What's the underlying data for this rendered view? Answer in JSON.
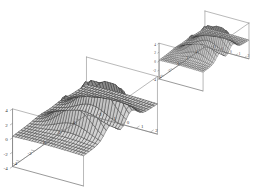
{
  "figure": {
    "title": "",
    "background_color": "#ffffff",
    "plot_count": 2
  },
  "chart_data": [
    {
      "id": "plot-large",
      "type": "surface",
      "title": "",
      "xlabel": "",
      "ylabel": "",
      "zlabel": "",
      "grid": false,
      "legend": "none",
      "xlim": [
        -5,
        5
      ],
      "ylim": [
        -2.5,
        2.5
      ],
      "zlim": [
        -4,
        4
      ],
      "xticks": [
        -4,
        -2,
        0,
        2,
        4
      ],
      "xtick_labels": [
        "-4",
        "-2",
        "0",
        "2",
        "4"
      ],
      "yticks": [
        -2,
        -1,
        0,
        1,
        2
      ],
      "ytick_labels": [
        "-2",
        "-1",
        "0",
        "1",
        "2"
      ],
      "zticks": [
        -4,
        -2,
        0,
        2,
        4
      ],
      "ztick_labels": [
        "-4",
        "-2",
        "0",
        "2",
        "4"
      ],
      "mesh_nx": 26,
      "mesh_ny": 26,
      "surface_fill": "#b4b4b4",
      "surface_fill_light": "#d8d8d8",
      "surface_fill_dark": "#8c8c8c",
      "mesh_line_color": "#2e2e2e",
      "view_azimuth": -58,
      "view_elevation": 26,
      "scale": 1.0,
      "description": "Two tall ridge peaks separated by a central saddle valley, rising from a flat plain"
    },
    {
      "id": "plot-inset",
      "type": "surface",
      "title": "",
      "xlabel": "",
      "ylabel": "",
      "zlabel": "",
      "grid": false,
      "legend": "none",
      "xlim": [
        -5,
        5
      ],
      "ylim": [
        -2.5,
        2.5
      ],
      "zlim": [
        -4,
        4
      ],
      "xticks": [
        -4,
        -2,
        0,
        2,
        4
      ],
      "xtick_labels": [
        "-4",
        "-2",
        "0",
        "2",
        "4"
      ],
      "yticks": [
        -2,
        -1,
        0,
        1,
        2
      ],
      "ytick_labels": [
        "-2",
        "-1",
        "0",
        "1",
        "2"
      ],
      "zticks": [
        -4,
        -2,
        0,
        2,
        4
      ],
      "ztick_labels": [
        "-4",
        "-2",
        "0",
        "2",
        "4"
      ],
      "mesh_nx": 26,
      "mesh_ny": 26,
      "surface_fill": "#b4b4b4",
      "surface_fill_light": "#d8d8d8",
      "surface_fill_dark": "#8c8c8c",
      "mesh_line_color": "#2e2e2e",
      "view_azimuth": -58,
      "view_elevation": 26,
      "scale": 0.62,
      "description": "Smaller duplicate of the same two-peak saddle surface"
    }
  ]
}
